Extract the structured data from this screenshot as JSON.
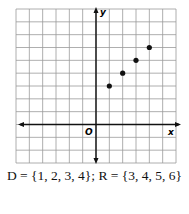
{
  "chart_data": {
    "type": "scatter",
    "title": "",
    "xlabel": "x",
    "ylabel": "y",
    "origin_label": "O",
    "xlim": [
      -6,
      6
    ],
    "ylim": [
      -3,
      9
    ],
    "grid": true,
    "points": [
      {
        "x": 1,
        "y": 3
      },
      {
        "x": 2,
        "y": 4
      },
      {
        "x": 3,
        "y": 5
      },
      {
        "x": 4,
        "y": 6
      }
    ],
    "caption": "D = {1, 2, 3, 4}; R = {3, 4, 5, 6}"
  },
  "style": {
    "grid_color": "#9a9a9a",
    "axis_color": "#111111",
    "point_color": "#111111"
  }
}
